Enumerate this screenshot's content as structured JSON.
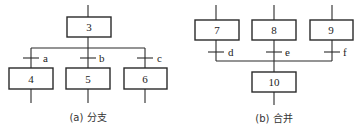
{
  "diagram_a": {
    "caption": "(a) 分支",
    "source_step": "3",
    "target_steps": [
      "4",
      "5",
      "6"
    ],
    "transitions": [
      "a",
      "b",
      "c"
    ]
  },
  "diagram_b": {
    "caption": "(b) 合并",
    "source_steps": [
      "7",
      "8",
      "9"
    ],
    "target_step": "10",
    "transitions": [
      "d",
      "e",
      "f"
    ]
  }
}
